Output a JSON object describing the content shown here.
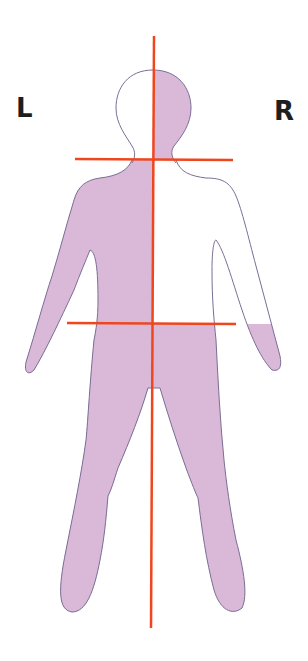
{
  "diagram": {
    "labels": {
      "left": "L",
      "right": "R"
    },
    "colors": {
      "shading": "#d9b8d8",
      "outline": "#7a6e96",
      "lines": "#f0461e",
      "background": "#ffffff",
      "text": "#1e1e1e"
    },
    "regions": [
      {
        "name": "head",
        "shaded_side": "right"
      },
      {
        "name": "torso-and-arms",
        "shaded_side": "left"
      },
      {
        "name": "legs",
        "shaded_side": "both"
      }
    ],
    "reference_lines": [
      {
        "name": "midline",
        "orientation": "vertical"
      },
      {
        "name": "neck-line",
        "orientation": "horizontal"
      },
      {
        "name": "hip-line",
        "orientation": "horizontal"
      }
    ]
  }
}
